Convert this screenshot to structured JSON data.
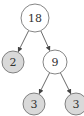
{
  "diagram": {
    "type": "binary-tree",
    "colors": {
      "leaf_fill": "#d9d9d9",
      "internal_fill": "#ffffff",
      "stroke": "#666666",
      "edge": "#444444"
    },
    "nodes": [
      {
        "id": "n18",
        "label": "18",
        "cx": 35,
        "cy": 18,
        "r": 14,
        "kind": "internal"
      },
      {
        "id": "n2",
        "label": "2",
        "cx": 13,
        "cy": 62,
        "r": 11,
        "kind": "leaf"
      },
      {
        "id": "n9",
        "label": "9",
        "cx": 55,
        "cy": 62,
        "r": 12,
        "kind": "internal"
      },
      {
        "id": "n3a",
        "label": "3",
        "cx": 34,
        "cy": 104,
        "r": 11,
        "kind": "leaf"
      },
      {
        "id": "n3b",
        "label": "3",
        "cx": 76,
        "cy": 104,
        "r": 11,
        "kind": "leaf"
      }
    ],
    "edges": [
      {
        "from": "n18",
        "to": "n2"
      },
      {
        "from": "n18",
        "to": "n9"
      },
      {
        "from": "n9",
        "to": "n3a"
      },
      {
        "from": "n9",
        "to": "n3b"
      }
    ]
  }
}
